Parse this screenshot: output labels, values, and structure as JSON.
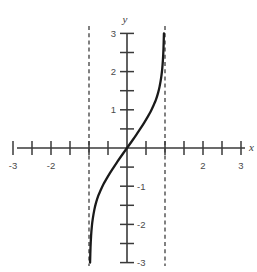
{
  "figure": {
    "name": "cartesian-graph",
    "background_color": "#ffffff",
    "width": 257,
    "height": 272,
    "axis_color": "#3a3a3a",
    "curve_color": "#1a1a1a",
    "asymptote_color": "#2e2e2e",
    "label_color": "#4a4a4a"
  },
  "chart_data": {
    "type": "line",
    "title": "",
    "subtitle": "",
    "xlabel": "x",
    "ylabel": "y",
    "xlim": [
      -3,
      3
    ],
    "ylim": [
      -3,
      3
    ],
    "grid": false,
    "legend": null,
    "x_major_ticks": [
      -3,
      -2,
      -1,
      0,
      1,
      2,
      3
    ],
    "x_minor_ticks": [
      -2.5,
      -1.5,
      -0.5,
      0.5,
      1.5,
      2.5
    ],
    "x_tick_labels": [
      {
        "value": -3,
        "text": "-3"
      },
      {
        "value": -2,
        "text": "-2"
      },
      {
        "value": 2,
        "text": "2"
      },
      {
        "value": 3,
        "text": "3"
      }
    ],
    "y_major_ticks": [
      -3,
      -2,
      -1,
      0,
      1,
      2,
      3
    ],
    "y_minor_ticks": [
      -2.5,
      -1.5,
      -0.5,
      0.5,
      1.5,
      2.5
    ],
    "y_tick_labels": [
      {
        "value": 3,
        "text": "3",
        "side": "left"
      },
      {
        "value": 2,
        "text": "2",
        "side": "left"
      },
      {
        "value": 1,
        "text": "1",
        "side": "left"
      },
      {
        "value": -1,
        "text": "-1",
        "side": "right"
      },
      {
        "value": -2,
        "text": "-2",
        "side": "right"
      },
      {
        "value": -3,
        "text": "-3",
        "side": "right"
      }
    ],
    "asymptotes": [
      {
        "type": "vertical",
        "x": -1,
        "style": "dashed"
      },
      {
        "type": "vertical",
        "x": 1,
        "style": "dashed"
      }
    ],
    "series": [
      {
        "name": "tangent-like-curve",
        "style": "solid",
        "points": [
          {
            "x": -0.972,
            "y": -3.0
          },
          {
            "x": -0.96,
            "y": -2.6
          },
          {
            "x": -0.945,
            "y": -2.3
          },
          {
            "x": -0.925,
            "y": -2.05
          },
          {
            "x": -0.9,
            "y": -1.85
          },
          {
            "x": -0.86,
            "y": -1.62
          },
          {
            "x": -0.82,
            "y": -1.45
          },
          {
            "x": -0.76,
            "y": -1.26
          },
          {
            "x": -0.7,
            "y": -1.12
          },
          {
            "x": -0.62,
            "y": -0.95
          },
          {
            "x": -0.54,
            "y": -0.81
          },
          {
            "x": -0.45,
            "y": -0.66
          },
          {
            "x": -0.36,
            "y": -0.52
          },
          {
            "x": -0.26,
            "y": -0.37
          },
          {
            "x": -0.15,
            "y": -0.21
          },
          {
            "x": 0.0,
            "y": 0.0
          },
          {
            "x": 0.15,
            "y": 0.21
          },
          {
            "x": 0.26,
            "y": 0.37
          },
          {
            "x": 0.36,
            "y": 0.52
          },
          {
            "x": 0.45,
            "y": 0.66
          },
          {
            "x": 0.54,
            "y": 0.81
          },
          {
            "x": 0.62,
            "y": 0.95
          },
          {
            "x": 0.7,
            "y": 1.12
          },
          {
            "x": 0.76,
            "y": 1.26
          },
          {
            "x": 0.82,
            "y": 1.45
          },
          {
            "x": 0.86,
            "y": 1.62
          },
          {
            "x": 0.9,
            "y": 1.85
          },
          {
            "x": 0.925,
            "y": 2.05
          },
          {
            "x": 0.945,
            "y": 2.3
          },
          {
            "x": 0.96,
            "y": 2.6
          },
          {
            "x": 0.972,
            "y": 3.0
          }
        ]
      }
    ]
  }
}
